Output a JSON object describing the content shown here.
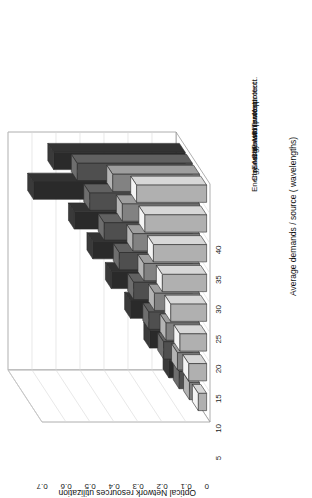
{
  "chart_data": {
    "type": "bar",
    "title": "",
    "subtitle": "",
    "xlabel": "Average demands / source ( wavelengths)",
    "ylabel": "Optical Network resources utilization",
    "orientation": "rotated-90ccw-3d",
    "grid": true,
    "legend_position": "right-outside",
    "categories": [
      "5",
      "10",
      "15",
      "20",
      "25",
      "30",
      "35",
      "40"
    ],
    "xticklabels": [
      "5",
      "10",
      "15",
      "20",
      "25",
      "30",
      "35",
      "40"
    ],
    "yticklabels": [
      "0",
      "0.1",
      "0.2",
      "0.3",
      "0.4",
      "0.5",
      "0.6",
      "0.7"
    ],
    "ylim": [
      0,
      0.7
    ],
    "ytick_values": [
      0,
      0.1,
      0.2,
      0.3,
      0.4,
      0.5,
      0.6,
      0.7
    ],
    "series": [
      {
        "name": "Closest IT w/o protect.",
        "color": "#f4f4f4",
        "values": [
          0.035,
          0.075,
          0.112,
          0.15,
          0.185,
          0.222,
          0.258,
          0.292
        ]
      },
      {
        "name": "Energy Aware w/o protect.",
        "color": "#b4b4b4",
        "values": [
          0.042,
          0.092,
          0.14,
          0.188,
          0.232,
          0.278,
          0.322,
          0.362
        ]
      },
      {
        "name": "Closest IT with protect.",
        "color": "#6e6e6e",
        "values": [
          0.055,
          0.12,
          0.182,
          0.245,
          0.305,
          0.368,
          0.428,
          0.48
        ]
      },
      {
        "name": "Energy Aware with protect.",
        "color": "#3a3a3a",
        "values": [
          0.068,
          0.148,
          0.228,
          0.308,
          0.385,
          0.462,
          0.632,
          0.548
        ]
      }
    ],
    "legend_order_top_to_bottom": [
      "Energy Aware with protect.",
      "Closest IT with protect.",
      "Energy Aware w/o protect.",
      "Closest IT w/o protect."
    ]
  }
}
